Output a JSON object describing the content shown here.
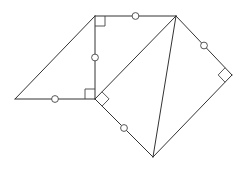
{
  "diagram": {
    "width": 246,
    "height": 171,
    "stroke_color": "#333333",
    "background": "#ffffff",
    "points": {
      "A": [
        95,
        16
      ],
      "B": [
        176,
        16
      ],
      "C": [
        15,
        99
      ],
      "D": [
        95,
        99
      ],
      "E": [
        232,
        75
      ],
      "F": [
        153,
        157
      ]
    },
    "segments": [
      {
        "id": "AB",
        "from": "A",
        "to": "B",
        "congruence_mark": "circle"
      },
      {
        "id": "AD",
        "from": "A",
        "to": "D",
        "congruence_mark": "circle"
      },
      {
        "id": "CD",
        "from": "C",
        "to": "D",
        "congruence_mark": "circle"
      },
      {
        "id": "CA",
        "from": "C",
        "to": "A",
        "congruence_mark": "none"
      },
      {
        "id": "BE",
        "from": "B",
        "to": "E",
        "congruence_mark": "circle"
      },
      {
        "id": "DF",
        "from": "D",
        "to": "F",
        "congruence_mark": "circle"
      },
      {
        "id": "EF",
        "from": "E",
        "to": "F",
        "congruence_mark": "none"
      },
      {
        "id": "DB",
        "from": "D",
        "to": "B",
        "congruence_mark": "none"
      },
      {
        "id": "BF",
        "from": "B",
        "to": "F",
        "congruence_mark": "none"
      }
    ],
    "right_angles": [
      {
        "at": "A",
        "between": [
          "B",
          "D"
        ]
      },
      {
        "at": "D",
        "between": [
          "A",
          "C"
        ]
      },
      {
        "at": "D",
        "between": [
          "B",
          "F"
        ]
      },
      {
        "at": "E",
        "between": [
          "B",
          "F"
        ]
      }
    ],
    "labels": []
  }
}
